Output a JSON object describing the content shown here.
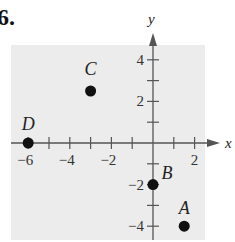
{
  "problem_number": "6.",
  "chart_data": {
    "type": "scatter",
    "title": "",
    "xlabel": "x",
    "ylabel": "y",
    "xlim": [
      -7,
      3
    ],
    "ylim": [
      -5,
      5
    ],
    "grid": false,
    "x_ticks": [
      -6,
      -5,
      -4,
      -3,
      -2,
      -1,
      1,
      2
    ],
    "x_tick_labels": [
      "-6",
      "-4",
      "-2",
      "2"
    ],
    "y_ticks": [
      -4,
      -3,
      -2,
      -1,
      1,
      2,
      3,
      4
    ],
    "y_tick_labels": [
      "-4",
      "-2",
      "2",
      "4"
    ],
    "points": [
      {
        "label": "A",
        "x": 1.5,
        "y": -4
      },
      {
        "label": "B",
        "x": 0,
        "y": -2
      },
      {
        "label": "C",
        "x": -3,
        "y": 2.5
      },
      {
        "label": "D",
        "x": -6,
        "y": 0
      }
    ],
    "background": "#ececec"
  }
}
